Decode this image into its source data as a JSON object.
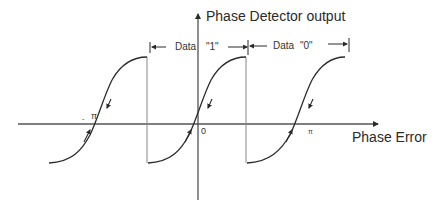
{
  "diagram": {
    "type": "phase-detector-characteristic",
    "title": "Phase Detector output",
    "x_axis_label": "Phase Error",
    "tick_labels": {
      "neg_pi_minus": "-",
      "neg_pi": "π",
      "zero": "0",
      "pos_pi": "π"
    },
    "intervals": [
      {
        "label_word": "Data",
        "label_value": "\"1\""
      },
      {
        "label_word": "Data",
        "label_value": "\"0\""
      }
    ],
    "curve": {
      "shape": "periodic sawtooth-like S-curve",
      "period_segments": 3,
      "zero_crossings": [
        "-π",
        "0",
        "π"
      ],
      "arrows": "convergence arrows toward each zero crossing"
    },
    "colors": {
      "line": "#2b2b2b",
      "axis": "#555555",
      "drop_line": "#888888",
      "background": "#ffffff"
    }
  }
}
